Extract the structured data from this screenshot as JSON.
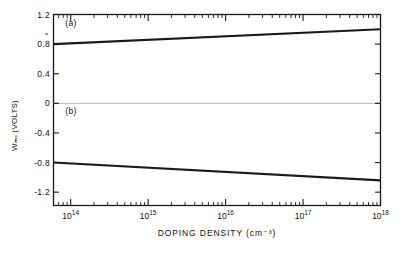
{
  "chart_data": {
    "type": "line",
    "title": "",
    "xlabel": "DOPING DENSITY (cm⁻³)",
    "ylabel": "Wₘₛ (VOLTS)",
    "xscale": "log",
    "xlim": [
      60000000000000.0,
      1e+18
    ],
    "ylim": [
      -1.38,
      1.2
    ],
    "grid": false,
    "legend": null,
    "xticks": [
      100000000000000.0,
      1000000000000000.0,
      1e+16,
      1e+17,
      1e+18
    ],
    "xtick_labels": [
      "10¹⁴",
      "10¹⁵",
      "10¹⁶",
      "10¹⁷",
      "10¹⁸"
    ],
    "yticks": [
      1.2,
      0.8,
      0.4,
      0,
      -0.4,
      -0.8,
      -1.2
    ],
    "ytick_labels": [
      "1.2",
      "0.8",
      "0.4",
      "0",
      "-0.4",
      "-0.8",
      "-1.2"
    ],
    "zero_line": 0,
    "annotations": [
      {
        "text": "(a)",
        "x": 85000000000000.0,
        "y": 1.07
      },
      {
        "text": "(b)",
        "x": 85000000000000.0,
        "y": -0.12
      }
    ],
    "series": [
      {
        "name": "(a)",
        "x": [
          60000000000000.0,
          1e+18
        ],
        "values": [
          0.8,
          1.0
        ],
        "color": "#1a1a1a"
      },
      {
        "name": "(b)",
        "x": [
          60000000000000.0,
          1e+18
        ],
        "values": [
          -0.8,
          -1.04
        ],
        "color": "#1a1a1a"
      }
    ]
  },
  "axes": {
    "frame_color": "#1a1a1a",
    "zero_line_color": "#b8b8b8",
    "tick_color": "#1a1a1a"
  }
}
